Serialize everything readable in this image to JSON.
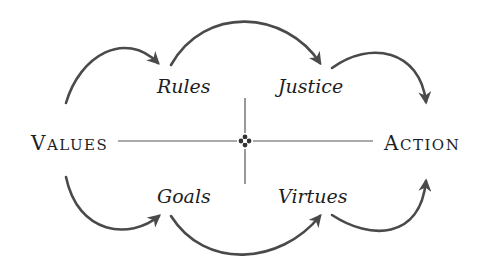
{
  "diagram": {
    "left_node": {
      "initial": "V",
      "rest": "ALUES",
      "full": "Values"
    },
    "right_node": {
      "initial": "A",
      "rest": "CTION",
      "full": "Action"
    },
    "upper_nodes": [
      {
        "label": "Rules"
      },
      {
        "label": "Justice"
      }
    ],
    "lower_nodes": [
      {
        "label": "Goals"
      },
      {
        "label": "Virtues"
      }
    ],
    "center_ornament": "cross-ornament",
    "edges": [
      {
        "from": "Values",
        "to": "Rules"
      },
      {
        "from": "Rules",
        "to": "Justice"
      },
      {
        "from": "Justice",
        "to": "Action"
      },
      {
        "from": "Values",
        "to": "Goals"
      },
      {
        "from": "Goals",
        "to": "Virtues"
      },
      {
        "from": "Virtues",
        "to": "Action"
      }
    ],
    "colors": {
      "text": "#1e1e1e",
      "arrow": "#4a4a4a",
      "axis": "#555555",
      "background": "#ffffff"
    }
  }
}
